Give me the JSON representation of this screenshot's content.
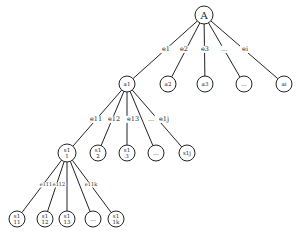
{
  "diagram": {
    "type": "tree",
    "colors": {
      "line": "#222222",
      "background": "#ffffff"
    },
    "nodes": [
      {
        "id": "A",
        "lines": [
          "A"
        ],
        "x": 204,
        "y": 15,
        "r": 9,
        "fs": 10
      },
      {
        "id": "a1",
        "lines": [
          "a1"
        ],
        "x": 127,
        "y": 84,
        "r": 8,
        "fs": 5.5
      },
      {
        "id": "a2",
        "lines": [
          "a2"
        ],
        "x": 168,
        "y": 84,
        "r": 8,
        "fs": 5.5
      },
      {
        "id": "a3",
        "lines": [
          "a3"
        ],
        "x": 205,
        "y": 84,
        "r": 8,
        "fs": 5.5
      },
      {
        "id": "adots",
        "lines": [
          "..."
        ],
        "x": 244,
        "y": 84,
        "r": 8,
        "fs": 6
      },
      {
        "id": "ai",
        "lines": [
          "ai"
        ],
        "x": 284,
        "y": 84,
        "r": 8,
        "fs": 5.5
      },
      {
        "id": "s11",
        "lines": [
          "s1",
          "1"
        ],
        "x": 67,
        "y": 153,
        "r": 9,
        "fs": 5.5
      },
      {
        "id": "s12",
        "lines": [
          "s1",
          "2"
        ],
        "x": 98,
        "y": 153,
        "r": 8,
        "fs": 5.5
      },
      {
        "id": "s13",
        "lines": [
          "s1",
          "3"
        ],
        "x": 127,
        "y": 153,
        "r": 8,
        "fs": 5.5
      },
      {
        "id": "sdots",
        "lines": [
          "..."
        ],
        "x": 156,
        "y": 153,
        "r": 8,
        "fs": 6
      },
      {
        "id": "s1j",
        "lines": [
          "s1j"
        ],
        "x": 187,
        "y": 153,
        "r": 8,
        "fs": 5.5
      },
      {
        "id": "s111",
        "lines": [
          "s1",
          "11"
        ],
        "x": 17,
        "y": 219,
        "r": 8,
        "fs": 5.5
      },
      {
        "id": "s112",
        "lines": [
          "s1",
          "12"
        ],
        "x": 45,
        "y": 219,
        "r": 8,
        "fs": 5.5
      },
      {
        "id": "s113",
        "lines": [
          "s1",
          "13"
        ],
        "x": 67,
        "y": 219,
        "r": 8,
        "fs": 5.5
      },
      {
        "id": "s1dots",
        "lines": [
          "..."
        ],
        "x": 93,
        "y": 219,
        "r": 8,
        "fs": 6
      },
      {
        "id": "s11k",
        "lines": [
          "s1",
          "1k"
        ],
        "x": 116,
        "y": 219,
        "r": 8,
        "fs": 5.5
      }
    ],
    "edges": [
      {
        "from": "A",
        "to": "a1"
      },
      {
        "from": "A",
        "to": "a2"
      },
      {
        "from": "A",
        "to": "a3"
      },
      {
        "from": "A",
        "to": "adots"
      },
      {
        "from": "A",
        "to": "ai"
      },
      {
        "from": "a1",
        "to": "s11"
      },
      {
        "from": "a1",
        "to": "s12"
      },
      {
        "from": "a1",
        "to": "s13"
      },
      {
        "from": "a1",
        "to": "sdots"
      },
      {
        "from": "a1",
        "to": "s1j"
      },
      {
        "from": "s11",
        "to": "s111"
      },
      {
        "from": "s11",
        "to": "s112"
      },
      {
        "from": "s11",
        "to": "s113"
      },
      {
        "from": "s11",
        "to": "s1dots"
      },
      {
        "from": "s11",
        "to": "s11k"
      }
    ],
    "edge_labels": [
      {
        "text": "e1",
        "x": 166,
        "y": 51,
        "fs": 6.5
      },
      {
        "text": "e2",
        "x": 184,
        "y": 51,
        "fs": 6.5
      },
      {
        "text": "e3",
        "x": 205,
        "y": 51,
        "fs": 6.5
      },
      {
        "text": "...",
        "x": 224,
        "y": 51,
        "fs": 6.5
      },
      {
        "text": "ei",
        "x": 245,
        "y": 51,
        "fs": 6.5
      },
      {
        "text": "e11",
        "x": 96,
        "y": 121,
        "fs": 6.5
      },
      {
        "text": "e12",
        "x": 114,
        "y": 121,
        "fs": 6.5
      },
      {
        "text": "e13",
        "x": 133,
        "y": 121,
        "fs": 6.5
      },
      {
        "text": "...",
        "x": 151,
        "y": 121,
        "fs": 6.5
      },
      {
        "text": "e1j",
        "x": 164,
        "y": 121,
        "fs": 6.5
      },
      {
        "text": "e111",
        "x": 46,
        "y": 186,
        "fs": 5
      },
      {
        "text": "e112",
        "x": 59,
        "y": 186,
        "fs": 5
      },
      {
        "text": "e11k",
        "x": 91,
        "y": 186,
        "fs": 5
      }
    ]
  }
}
